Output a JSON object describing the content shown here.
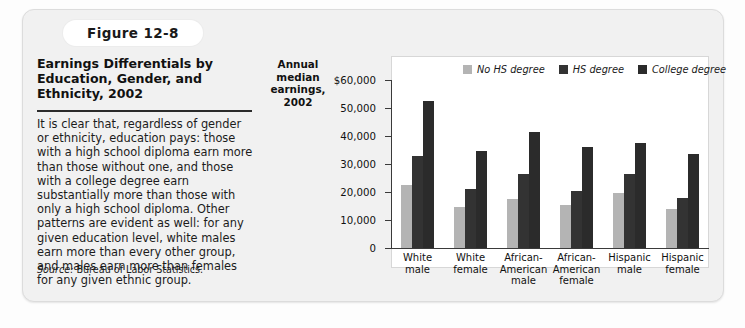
{
  "figure": {
    "tab_label": "Figure 12-8",
    "title": "Earnings Differentials by Education, Gender, and Ethnicity, 2002",
    "body": "It is clear that, regardless of gender or ethnicity, education pays: those with a high school diploma earn more than those without one, and those with a college degree earn substantially more than those with only a high school diploma. Other patterns are evident as well: for any given education level, white males earn more than every other group, and males earn more than females for any given ethnic group.",
    "source_label": "Source:",
    "source_text": " Bureau of Labor Statistics."
  },
  "chart_data": {
    "type": "bar",
    "title": "",
    "axis_title": "Annual median earnings, 2002",
    "xlabel": "",
    "ylabel": "Annual median earnings, 2002",
    "ylim": [
      0,
      60000
    ],
    "grid": false,
    "legend_position": "top-right",
    "ytick_labels": [
      "$60,000",
      "50,000",
      "40,000",
      "30,000",
      "20,000",
      "10,000",
      "0"
    ],
    "ytick_values": [
      60000,
      50000,
      40000,
      30000,
      20000,
      10000,
      0
    ],
    "categories": [
      "White male",
      "White female",
      "African-American male",
      "African-American female",
      "Hispanic male",
      "Hispanic female"
    ],
    "categories_lines": [
      [
        "White",
        "male"
      ],
      [
        "White",
        "female"
      ],
      [
        "African-",
        "American",
        "male"
      ],
      [
        "African-",
        "American",
        "female"
      ],
      [
        "Hispanic",
        "male"
      ],
      [
        "Hispanic",
        "female"
      ]
    ],
    "series": [
      {
        "name": "No HS degree",
        "color": "#b4b4b4",
        "values": [
          22500,
          14500,
          17500,
          15500,
          19500,
          14000
        ]
      },
      {
        "name": "HS degree",
        "color": "#333333",
        "values": [
          33000,
          21000,
          26500,
          20500,
          26500,
          18000
        ]
      },
      {
        "name": "College degree",
        "color": "#2b2b2b",
        "values": [
          52500,
          34500,
          41500,
          36000,
          37500,
          33500
        ]
      }
    ]
  }
}
